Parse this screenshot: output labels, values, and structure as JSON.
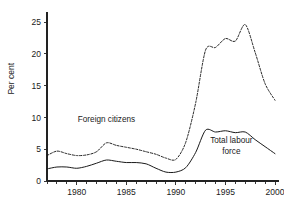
{
  "chart_data": {
    "type": "line",
    "title": "",
    "subtitle": "",
    "xlabel": "",
    "ylabel": "Per cent",
    "xlim": [
      1977,
      2000
    ],
    "ylim": [
      0,
      26.5
    ],
    "grid": false,
    "legend_position": "inline-annotations",
    "y_ticks": [
      0,
      5,
      10,
      15,
      20,
      25
    ],
    "y_tick_labels": [
      "0",
      "5",
      "10",
      "15",
      "20",
      "25"
    ],
    "x_ticks": [
      1980,
      1985,
      1990,
      1995,
      2000
    ],
    "x_tick_labels": [
      "1980",
      "1985",
      "1990",
      "1995",
      "2000"
    ],
    "x_minor_ticks": [
      1977,
      1978,
      1979,
      1981,
      1982,
      1983,
      1984,
      1986,
      1987,
      1988,
      1989,
      1991,
      1992,
      1993,
      1994,
      1996,
      1997,
      1998,
      1999
    ],
    "x": [
      1977,
      1978,
      1979,
      1980,
      1981,
      1982,
      1983,
      1984,
      1985,
      1986,
      1987,
      1988,
      1989,
      1990,
      1991,
      1992,
      1993,
      1994,
      1995,
      1996,
      1997,
      1998,
      1999,
      2000
    ],
    "series": [
      {
        "name": "Foreign citizens",
        "style": "dashed",
        "color": "#1a1a1a",
        "label_x": 1983.0,
        "label_y": 9.3,
        "values": [
          4.0,
          4.7,
          4.3,
          4.0,
          4.1,
          4.6,
          6.0,
          5.6,
          5.3,
          5.0,
          4.6,
          4.2,
          3.6,
          3.4,
          6.1,
          12.3,
          20.6,
          21.0,
          22.4,
          22.0,
          24.6,
          20.2,
          15.3,
          12.7
        ]
      },
      {
        "name": "Total labour force",
        "style": "solid",
        "color": "#1a1a1a",
        "label_x": 1995.6,
        "label_y": 5.5,
        "values": [
          1.9,
          2.2,
          2.2,
          2.0,
          2.3,
          2.8,
          3.3,
          3.1,
          2.9,
          2.9,
          2.7,
          2.0,
          1.4,
          1.4,
          2.1,
          4.5,
          8.0,
          7.7,
          7.9,
          7.6,
          7.7,
          6.5,
          5.4,
          4.3
        ]
      }
    ],
    "annotations": [
      {
        "text": "Foreign citizens",
        "x": 1983.0,
        "y": 9.3
      },
      {
        "text": "Total labour",
        "x": 1995.6,
        "y": 5.9
      },
      {
        "text": "force",
        "x": 1995.6,
        "y": 4.3
      }
    ]
  },
  "axis": {
    "y_title": "Per cent"
  }
}
